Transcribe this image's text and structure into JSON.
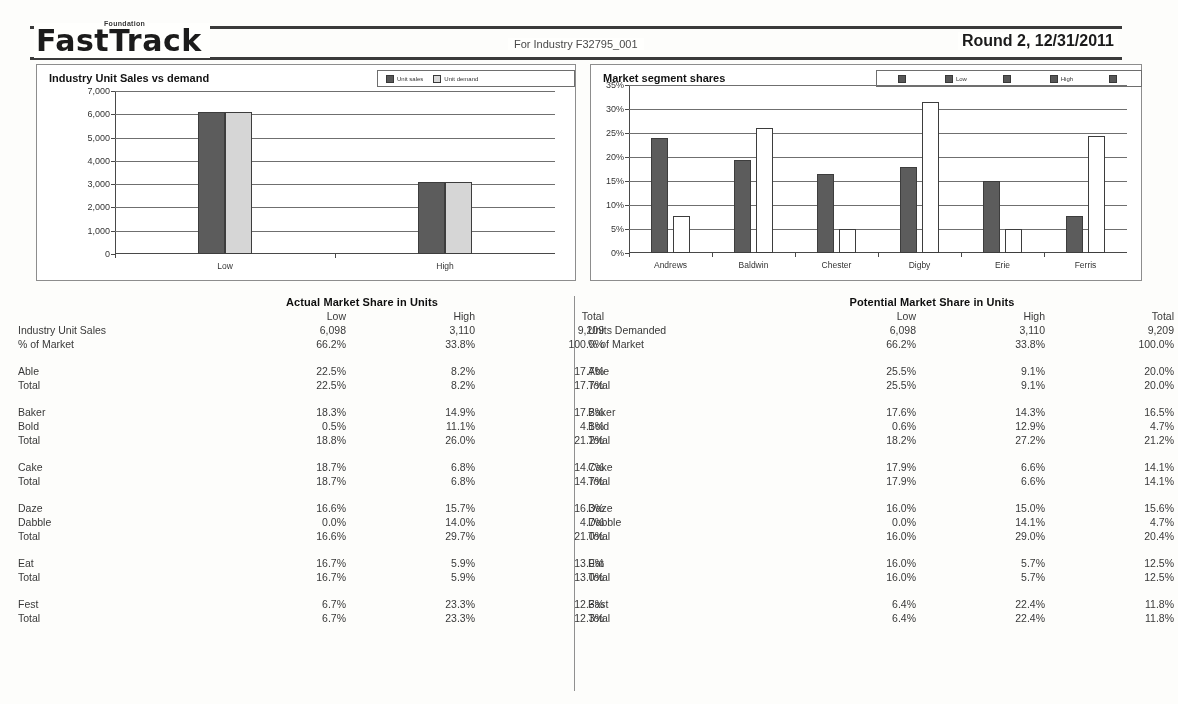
{
  "header": {
    "logo": "FastTrack",
    "logo_sup": "Foundation",
    "industry": "For Industry F32795_001",
    "round": "Round 2, 12/31/2011"
  },
  "charts": {
    "left": {
      "title": "Industry Unit Sales vs demand",
      "legend": [
        "Unit sales",
        "Unit demand"
      ]
    },
    "right": {
      "title": "Market segment shares",
      "legend": [
        "",
        "Low",
        "",
        "High",
        ""
      ]
    }
  },
  "chart_data": [
    {
      "type": "bar",
      "title": "Industry Unit Sales vs demand",
      "xlabel": "",
      "ylabel": "",
      "categories": [
        "Low",
        "High"
      ],
      "series": [
        {
          "name": "Unit sales",
          "values": [
            6098,
            3110
          ]
        },
        {
          "name": "Unit demand",
          "values": [
            6098,
            3110
          ]
        }
      ],
      "ylim": [
        0,
        7000
      ],
      "yticks": [
        "0",
        "1,000",
        "2,000",
        "3,000",
        "4,000",
        "5,000",
        "6,000",
        "7,000"
      ],
      "grid": true,
      "legend_position": "top-right"
    },
    {
      "type": "bar",
      "title": "Market segment shares",
      "xlabel": "",
      "ylabel": "",
      "categories": [
        "Andrews",
        "Baldwin",
        "Chester",
        "Digby",
        "Erie",
        "Ferris"
      ],
      "series": [
        {
          "name": "Low",
          "values": [
            24.0,
            19.3,
            16.5,
            18.0,
            15.0,
            7.8
          ]
        },
        {
          "name": "High",
          "values": [
            7.8,
            26.1,
            5.1,
            31.5,
            5.0,
            24.4
          ]
        }
      ],
      "ylim": [
        0,
        35
      ],
      "yticks": [
        "0%",
        "5%",
        "10%",
        "15%",
        "20%",
        "25%",
        "30%",
        "35%"
      ],
      "grid": true,
      "legend_position": "top-right"
    }
  ],
  "tables": {
    "actual": {
      "title": "Actual Market Share in Units",
      "columns": [
        "",
        "Low",
        "High",
        "Total"
      ],
      "rows": [
        {
          "label": "Industry Unit Sales",
          "low": "6,098",
          "high": "3,110",
          "total": "9,209"
        },
        {
          "label": "% of Market",
          "low": "66.2%",
          "high": "33.8%",
          "total": "100.0%"
        },
        {
          "spacer": true
        },
        {
          "label": "Able",
          "low": "22.5%",
          "high": "8.2%",
          "total": "17.7%"
        },
        {
          "label": "Total",
          "low": "22.5%",
          "high": "8.2%",
          "total": "17.7%"
        },
        {
          "spacer": true
        },
        {
          "label": "Baker",
          "low": "18.3%",
          "high": "14.9%",
          "total": "17.2%"
        },
        {
          "label": "Bold",
          "low": "0.5%",
          "high": "11.1%",
          "total": "4.1%"
        },
        {
          "label": "Total",
          "low": "18.8%",
          "high": "26.0%",
          "total": "21.2%"
        },
        {
          "spacer": true
        },
        {
          "label": "Cake",
          "low": "18.7%",
          "high": "6.8%",
          "total": "14.7%"
        },
        {
          "label": "Total",
          "low": "18.7%",
          "high": "6.8%",
          "total": "14.7%"
        },
        {
          "spacer": true
        },
        {
          "label": "Daze",
          "low": "16.6%",
          "high": "15.7%",
          "total": "16.3%"
        },
        {
          "label": "Dabble",
          "low": "0.0%",
          "high": "14.0%",
          "total": "4.7%"
        },
        {
          "label": "Total",
          "low": "16.6%",
          "high": "29.7%",
          "total": "21.0%"
        },
        {
          "spacer": true
        },
        {
          "label": "Eat",
          "low": "16.7%",
          "high": "5.9%",
          "total": "13.0%"
        },
        {
          "label": "Total",
          "low": "16.7%",
          "high": "5.9%",
          "total": "13.0%"
        },
        {
          "spacer": true
        },
        {
          "label": "Fest",
          "low": "6.7%",
          "high": "23.3%",
          "total": "12.3%"
        },
        {
          "label": "Total",
          "low": "6.7%",
          "high": "23.3%",
          "total": "12.3%"
        }
      ]
    },
    "potential": {
      "title": "Potential Market Share in Units",
      "columns": [
        "",
        "Low",
        "High",
        "Total"
      ],
      "rows": [
        {
          "label": "Units Demanded",
          "low": "6,098",
          "high": "3,110",
          "total": "9,209"
        },
        {
          "label": "% of Market",
          "low": "66.2%",
          "high": "33.8%",
          "total": "100.0%"
        },
        {
          "spacer": true
        },
        {
          "label": "Able",
          "low": "25.5%",
          "high": "9.1%",
          "total": "20.0%"
        },
        {
          "label": "Total",
          "low": "25.5%",
          "high": "9.1%",
          "total": "20.0%"
        },
        {
          "spacer": true
        },
        {
          "label": "Baker",
          "low": "17.6%",
          "high": "14.3%",
          "total": "16.5%"
        },
        {
          "label": "Bold",
          "low": "0.6%",
          "high": "12.9%",
          "total": "4.7%"
        },
        {
          "label": "Total",
          "low": "18.2%",
          "high": "27.2%",
          "total": "21.2%"
        },
        {
          "spacer": true
        },
        {
          "label": "Cake",
          "low": "17.9%",
          "high": "6.6%",
          "total": "14.1%"
        },
        {
          "label": "Total",
          "low": "17.9%",
          "high": "6.6%",
          "total": "14.1%"
        },
        {
          "spacer": true
        },
        {
          "label": "Daze",
          "low": "16.0%",
          "high": "15.0%",
          "total": "15.6%"
        },
        {
          "label": "Dabble",
          "low": "0.0%",
          "high": "14.1%",
          "total": "4.7%"
        },
        {
          "label": "Total",
          "low": "16.0%",
          "high": "29.0%",
          "total": "20.4%"
        },
        {
          "spacer": true
        },
        {
          "label": "Eat",
          "low": "16.0%",
          "high": "5.7%",
          "total": "12.5%"
        },
        {
          "label": "Total",
          "low": "16.0%",
          "high": "5.7%",
          "total": "12.5%"
        },
        {
          "spacer": true
        },
        {
          "label": "Fast",
          "low": "6.4%",
          "high": "22.4%",
          "total": "11.8%"
        },
        {
          "label": "Total",
          "low": "6.4%",
          "high": "22.4%",
          "total": "11.8%"
        }
      ]
    }
  },
  "colors": {
    "series_dark": "#5d5d5d",
    "series_light": "#d4d4d4",
    "series_white": "#ffffff",
    "rule": "#3b3b3b"
  }
}
